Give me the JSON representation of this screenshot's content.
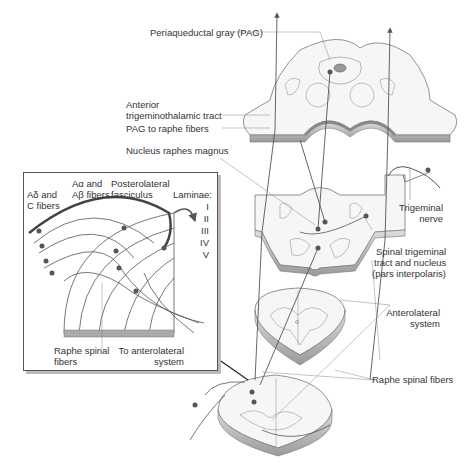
{
  "figure": {
    "main_labels": {
      "pag": "Periaqueductal gray (PAG)",
      "anterior_1": "Anterior",
      "anterior_2": "trigeminothalamic tract",
      "pag_raphe": "PAG to raphe fibers",
      "nrm": "Nucleus raphes magnus",
      "trig_nerve_1": "Trigeminal",
      "trig_nerve_2": "nerve",
      "spinal_trig_1": "Spinal trigeminal",
      "spinal_trig_2": "tract and nucleus",
      "spinal_trig_3": "(pars interpolaris)",
      "antero_1": "Anterolateral",
      "antero_2": "system",
      "raphe_spinal": "Raphe spinal fibers"
    },
    "inset_labels": {
      "adelta_1": "Aδ and",
      "adelta_2": "C fibers",
      "aalpha_1": "Aα and",
      "aalpha_2": "Aβ fibers",
      "postero_1": "Posterolateral",
      "postero_2": "fasciculus",
      "laminae": "Laminae:",
      "lam_i": "I",
      "lam_ii": "II",
      "lam_iii": "III",
      "lam_iv": "IV",
      "lam_v": "V",
      "raphe_1": "Raphe spinal",
      "raphe_2": "fibers",
      "to_antero_1": "To anterolateral",
      "to_antero_2": "system"
    },
    "colors": {
      "line": "#444444",
      "fiber": "#555555",
      "neuron": "#666666",
      "tissue_edge": "#999999",
      "tissue_fill": "#f4f4f4",
      "bar": "#aaaaaa"
    }
  }
}
